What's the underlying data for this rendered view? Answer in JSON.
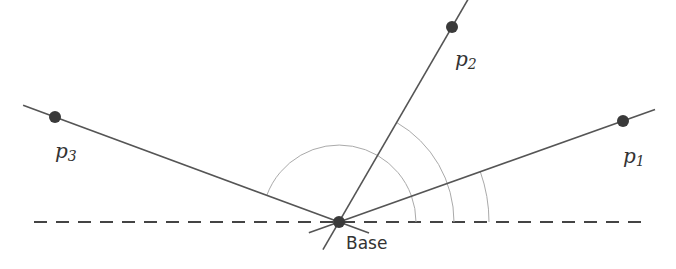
{
  "diagram": {
    "type": "geometry-angles",
    "base": {
      "label": "Base",
      "x": 339,
      "y": 222
    },
    "points": [
      {
        "id": "p1",
        "letter": "p",
        "subscript": "1",
        "x": 623,
        "y": 121,
        "label_x": 623,
        "label_y": 163
      },
      {
        "id": "p2",
        "letter": "p",
        "subscript": "2",
        "x": 452,
        "y": 27,
        "label_x": 455,
        "label_y": 66
      },
      {
        "id": "p3",
        "letter": "p",
        "subscript": "3",
        "x": 55,
        "y": 117,
        "label_x": 55,
        "label_y": 158
      }
    ],
    "reference_line": {
      "style": "dashed",
      "x1": 34,
      "x2": 642,
      "y": 222
    },
    "angle_arcs": [
      {
        "target": "p3",
        "radius": 77
      },
      {
        "target": "p2",
        "radius": 115
      },
      {
        "target": "p1",
        "radius": 150
      }
    ],
    "colors": {
      "line": "#555555",
      "dot": "#3a3a3a",
      "arc": "#aaaaaa",
      "dash": "#444444",
      "text": "#333333"
    }
  }
}
